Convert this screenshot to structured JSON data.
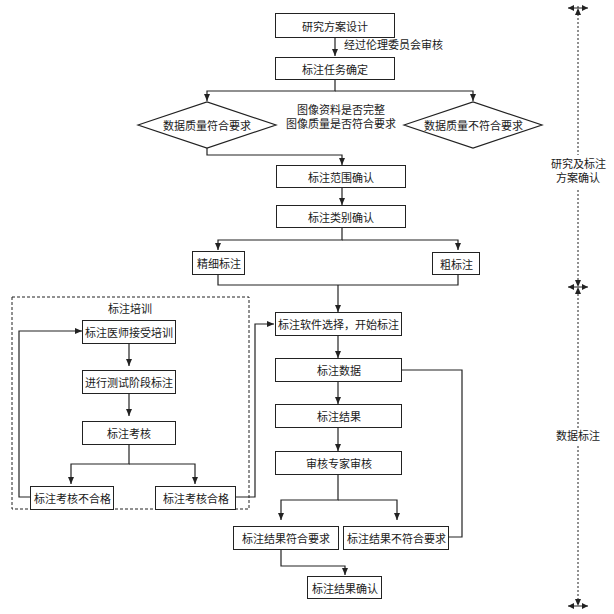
{
  "diagram": {
    "type": "flowchart",
    "nodes": {
      "research_design": "研究方案设计",
      "task_confirm": "标注任务确定",
      "quality_ok": "数据质量符合要求",
      "quality_fail": "数据质量不符合要求",
      "scope_confirm": "标注范围确认",
      "category_confirm": "标注类别确认",
      "fine_label": "精细标注",
      "coarse_label": "粗标注",
      "software_select": "标注软件选择，开始标注",
      "label_data": "标注数据",
      "label_result": "标注结果",
      "expert_review": "审核专家审核",
      "result_ok": "标注结果符合要求",
      "result_fail": "标注结果不符合要求",
      "result_confirm": "标注结果确认",
      "doctor_training": "标注医师接受培训",
      "test_labeling": "进行测试阶段标注",
      "label_exam": "标注考核",
      "exam_fail": "标注考核不合格",
      "exam_pass": "标注考核合格"
    },
    "edge_labels": {
      "ethics_review": "经过伦理委员会审核",
      "check_line1": "图像资料是否完整",
      "check_line2": "图像质量是否符合要求"
    },
    "groups": {
      "training_title": "标注培训"
    },
    "phases": [
      {
        "label_line1": "研究及标注",
        "label_line2": "方案确认"
      },
      {
        "label_line1": "数据标注",
        "label_line2": ""
      }
    ]
  }
}
